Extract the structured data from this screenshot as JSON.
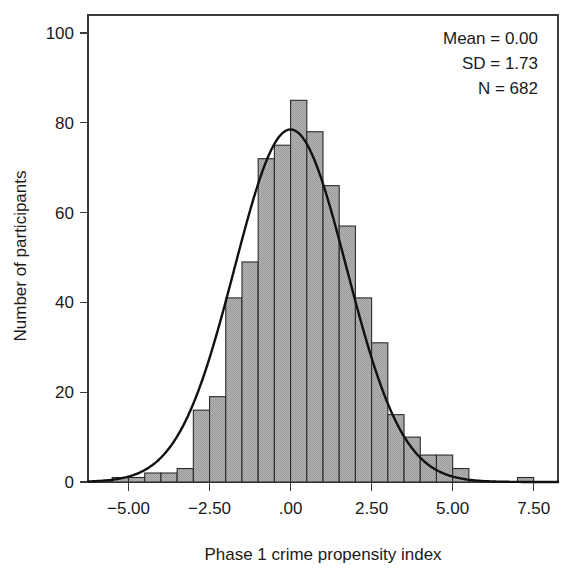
{
  "chart_data": {
    "type": "bar",
    "title": "",
    "subtitle": "",
    "xlabel": "Phase 1 crime propensity index",
    "ylabel": "Number of participants",
    "xlim": [
      -6.25,
      8.25
    ],
    "ylim": [
      0,
      104
    ],
    "grid": false,
    "legend": null,
    "bin_width": 0.5,
    "x_ticks": [
      {
        "value": -5.0,
        "label": "−5.00"
      },
      {
        "value": -2.5,
        "label": "−2.50"
      },
      {
        "value": 0.0,
        "label": ".00"
      },
      {
        "value": 2.5,
        "label": "2.50"
      },
      {
        "value": 5.0,
        "label": "5.00"
      },
      {
        "value": 7.5,
        "label": "7.50"
      }
    ],
    "y_ticks": [
      {
        "value": 0,
        "label": "0"
      },
      {
        "value": 20,
        "label": "20"
      },
      {
        "value": 40,
        "label": "40"
      },
      {
        "value": 60,
        "label": "60"
      },
      {
        "value": 80,
        "label": "80"
      },
      {
        "value": 100,
        "label": "100"
      }
    ],
    "bin_centers": [
      -5.25,
      -4.75,
      -4.25,
      -3.75,
      -3.25,
      -2.75,
      -2.25,
      -1.75,
      -1.25,
      -0.75,
      -0.25,
      0.25,
      0.75,
      1.25,
      1.75,
      2.25,
      2.75,
      3.25,
      3.75,
      4.25,
      4.75,
      5.25,
      7.25
    ],
    "values": [
      1,
      1,
      2,
      2,
      3,
      16,
      19,
      41,
      49,
      72,
      75,
      85,
      78,
      66,
      57,
      41,
      31,
      15,
      10,
      6,
      6,
      3,
      1
    ],
    "bars": [
      {
        "center": -5.25,
        "count": 1
      },
      {
        "center": -4.75,
        "count": 1
      },
      {
        "center": -4.25,
        "count": 2
      },
      {
        "center": -3.75,
        "count": 2
      },
      {
        "center": -3.25,
        "count": 3
      },
      {
        "center": -2.75,
        "count": 16
      },
      {
        "center": -2.25,
        "count": 19
      },
      {
        "center": -1.75,
        "count": 41
      },
      {
        "center": -1.25,
        "count": 49
      },
      {
        "center": -0.75,
        "count": 72
      },
      {
        "center": -0.25,
        "count": 75
      },
      {
        "center": 0.25,
        "count": 85
      },
      {
        "center": 0.75,
        "count": 78
      },
      {
        "center": 1.25,
        "count": 66
      },
      {
        "center": 1.75,
        "count": 57
      },
      {
        "center": 2.25,
        "count": 41
      },
      {
        "center": 2.75,
        "count": 31
      },
      {
        "center": 3.25,
        "count": 15
      },
      {
        "center": 3.75,
        "count": 10
      },
      {
        "center": 4.25,
        "count": 6
      },
      {
        "center": 4.75,
        "count": 6
      },
      {
        "center": 5.25,
        "count": 3
      },
      {
        "center": 7.25,
        "count": 1
      }
    ],
    "overlay_curve": {
      "kind": "normal",
      "mean": 0.0,
      "sd": 1.73,
      "n": 682,
      "peak_value": 78.5
    },
    "colors": {
      "bar_fill": "#a9a9a9",
      "bar_edge": "#2b2b2b",
      "curve": "#111111",
      "axis": "#3a3a3a",
      "text": "#1a1a1a",
      "background": "#ffffff"
    }
  },
  "annotations": {
    "mean": "Mean = 0.00",
    "sd": "SD = 1.73",
    "n_italic": "N",
    "n_rest": " = 682"
  }
}
